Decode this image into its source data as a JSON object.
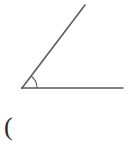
{
  "figure": {
    "background_color": "#ffffff",
    "stroke_color": "#5c5c61",
    "arc_color": "#5c5c61",
    "stroke_width": 1.6,
    "arc_stroke_width": 1.1,
    "vertex": {
      "x": 22,
      "y": 88
    },
    "rays": [
      {
        "name": "horizontal-ray",
        "from": {
          "x": 22,
          "y": 88
        },
        "to": {
          "x": 123,
          "y": 88
        },
        "direction_degrees": 0
      },
      {
        "name": "diagonal-ray",
        "from": {
          "x": 22,
          "y": 88
        },
        "to": {
          "x": 85,
          "y": 5
        },
        "direction_degrees": 52.8
      }
    ],
    "angle_arc": {
      "radius": 15,
      "start_degrees": 0,
      "end_degrees": 52.8,
      "measure_label": ""
    }
  },
  "labels": {
    "paren": "(",
    "paren_color": "#2b2b2f"
  },
  "chart_data": {
    "type": "line",
    "title": "",
    "xlabel": "",
    "ylabel": "",
    "grid": false,
    "legend_position": "none",
    "xlim": [
      0,
      131
    ],
    "ylim": [
      145,
      0
    ],
    "annotations": [
      "("
    ],
    "series": [
      {
        "name": "horizontal-ray",
        "x": [
          22,
          123
        ],
        "y": [
          88,
          88
        ]
      },
      {
        "name": "diagonal-ray",
        "x": [
          22,
          85
        ],
        "y": [
          88,
          5
        ]
      },
      {
        "name": "angle-arc",
        "x": [
          37,
          31,
          25
        ],
        "y": [
          88,
          78,
          75
        ]
      }
    ]
  }
}
